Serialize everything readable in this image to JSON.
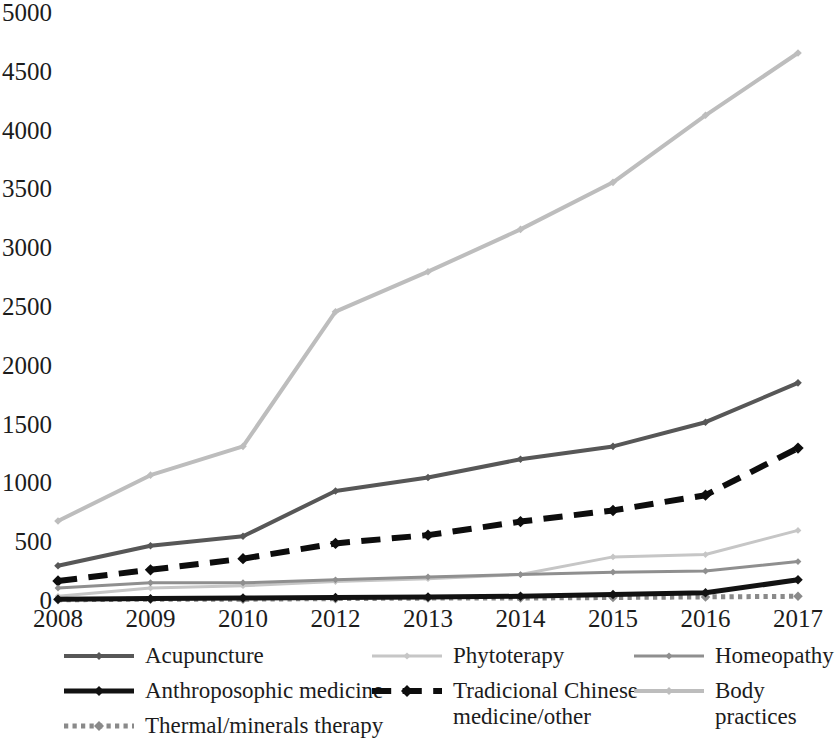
{
  "chart_data": {
    "type": "line",
    "title": "",
    "xlabel": "",
    "ylabel": "",
    "x": [
      "2008",
      "2009",
      "2010",
      "2012",
      "2013",
      "2014",
      "2015",
      "2016",
      "2017"
    ],
    "categories": [
      "2008",
      "2009",
      "2010",
      "2012",
      "2013",
      "2014",
      "2015",
      "2016",
      "2017"
    ],
    "ylim": [
      0,
      5000
    ],
    "yticks": [
      0,
      500,
      1000,
      1500,
      2000,
      2500,
      3000,
      3500,
      4000,
      4500,
      5000
    ],
    "ytick_labels": [
      "0",
      "500",
      "1000",
      "1500",
      "2000",
      "2500",
      "3000",
      "3500",
      "4000",
      "4500",
      "5000"
    ],
    "grid": false,
    "legend_position": "bottom",
    "series": [
      {
        "name": "Acupuncture",
        "values": [
          300,
          470,
          550,
          935,
          1050,
          1205,
          1315,
          1520,
          1855
        ],
        "color": "#575757",
        "style": "solid",
        "width": 4,
        "marker": "diamond"
      },
      {
        "name": "Phytoterapy",
        "values": [
          40,
          110,
          130,
          165,
          190,
          225,
          375,
          395,
          600
        ],
        "color": "#c6c6c6",
        "style": "solid",
        "width": 3,
        "marker": "diamond"
      },
      {
        "name": "Homeopathy",
        "values": [
          110,
          155,
          155,
          180,
          205,
          225,
          245,
          255,
          335
        ],
        "color": "#8f8f8f",
        "style": "solid",
        "width": 3,
        "marker": "diamond"
      },
      {
        "name": "Anthroposophic medicine",
        "values": [
          15,
          20,
          25,
          30,
          35,
          40,
          55,
          70,
          180
        ],
        "color": "#121212",
        "style": "solid",
        "width": 5,
        "marker": "diamond"
      },
      {
        "name": "Tradicional Chinese medicine/other",
        "values": [
          170,
          265,
          360,
          490,
          560,
          675,
          770,
          900,
          1300
        ],
        "color": "#0d0d0d",
        "style": "dashed",
        "width": 6,
        "marker": "diamond"
      },
      {
        "name": "Body practices",
        "values": [
          680,
          1070,
          1315,
          2460,
          2800,
          3160,
          3560,
          4130,
          4660
        ],
        "color": "#bdbdbd",
        "style": "solid",
        "width": 4,
        "marker": "diamond"
      },
      {
        "name": "Thermal/minerals therapy",
        "values": [
          10,
          15,
          15,
          20,
          25,
          25,
          30,
          35,
          40
        ],
        "color": "#8a8a8a",
        "style": "dotted",
        "width": 5,
        "marker": "diamond"
      }
    ]
  },
  "legend": {
    "items": [
      {
        "label": "Acupuncture"
      },
      {
        "label": "Phytoterapy"
      },
      {
        "label": "Homeopathy"
      },
      {
        "label": "Anthroposophic medicine"
      },
      {
        "label": "Tradicional Chinese\nmedicine/other"
      },
      {
        "label": "Body practices"
      },
      {
        "label": "Thermal/minerals therapy"
      }
    ]
  }
}
